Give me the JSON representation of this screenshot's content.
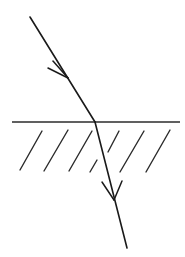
{
  "figure": {
    "background_color": "#ffffff",
    "ink_color": "#1a1a1a",
    "width": 185,
    "height": 257
  },
  "chart_data": {
    "type": "diagram",
    "xlabel": "",
    "ylabel": "",
    "grid": false,
    "legend": null,
    "xlim": [
      0,
      185
    ],
    "ylim": [
      0,
      257
    ],
    "note": "Hand-drawn ray optics sketch. Coordinates are in image pixels with y increasing downward.",
    "elements": [
      {
        "name": "incident-ray",
        "kind": "line",
        "from": [
          30,
          17
        ],
        "to": [
          95,
          122
        ],
        "arrow": "mid",
        "arrow_at": [
          68,
          78
        ],
        "color": "#1a1a1a",
        "width": 1.6
      },
      {
        "name": "interface-line",
        "kind": "line",
        "from": [
          12,
          122
        ],
        "to": [
          180,
          122
        ],
        "arrow": "none",
        "color": "#2b2b2b",
        "width": 1.5
      },
      {
        "name": "refracted-ray",
        "kind": "line",
        "from": [
          95,
          122
        ],
        "to": [
          127,
          248
        ],
        "arrow": "mid",
        "arrow_at": [
          113,
          196
        ],
        "color": "#1a1a1a",
        "width": 1.6
      }
    ],
    "hatching": {
      "name": "medium-hatching",
      "side": "below-interface",
      "count": 7,
      "angle_deg": 60,
      "color": "#2b2b2b",
      "width": 1.4,
      "strokes": [
        {
          "from": [
            20,
            170
          ],
          "to": [
            42,
            131
          ],
          "broken": false
        },
        {
          "from": [
            44,
            171
          ],
          "to": [
            68,
            130
          ],
          "broken": false
        },
        {
          "from": [
            69,
            171
          ],
          "to": [
            92,
            131
          ],
          "broken": false
        },
        {
          "from": [
            90,
            172
          ],
          "to": [
            97,
            160
          ],
          "broken": true
        },
        {
          "from": [
            108,
            152
          ],
          "to": [
            119,
            131
          ],
          "broken": true
        },
        {
          "from": [
            120,
            172
          ],
          "to": [
            144,
            131
          ],
          "broken": false
        },
        {
          "from": [
            146,
            172
          ],
          "to": [
            170,
            130
          ],
          "broken": false
        }
      ]
    },
    "arrowheads": [
      {
        "name": "incident-arrowhead",
        "tip": [
          68,
          78
        ],
        "style": "open-v",
        "barbs": [
          {
            "from": [
              68,
              78
            ],
            "to": [
              48,
              68
            ]
          },
          {
            "from": [
              68,
              78
            ],
            "to": [
              53,
              61
            ]
          }
        ]
      },
      {
        "name": "refracted-arrowhead",
        "tip": [
          114,
          200
        ],
        "style": "open-v",
        "barbs": [
          {
            "from": [
              114,
              200
            ],
            "to": [
              102,
              182
            ]
          },
          {
            "from": [
              114,
              200
            ],
            "to": [
              122,
              181
            ]
          }
        ]
      }
    ]
  }
}
